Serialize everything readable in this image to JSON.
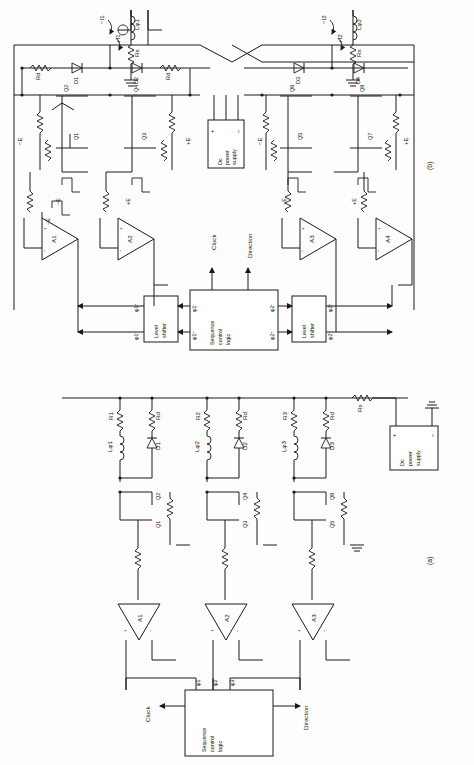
{
  "figure": {
    "orientation": "rotated-90",
    "part_labels": {
      "a": "(a)",
      "b": "(b)"
    }
  },
  "part_a": {
    "caption": "(a)",
    "description": "Unipolar three-phase stepper drive with suppression diodes",
    "phases": [
      {
        "winding": "Lφ1",
        "series_resistor": "R1",
        "damp_resistor": "Rd",
        "diode": "D1",
        "transistors": [
          "Q1",
          "Q2"
        ],
        "amplifier": "A1",
        "drive": "φ1"
      },
      {
        "winding": "Lφ2",
        "series_resistor": "R2",
        "damp_resistor": "Rd",
        "diode": "D2",
        "transistors": [
          "Q3",
          "Q4"
        ],
        "amplifier": "A2",
        "drive": "φ2"
      },
      {
        "winding": "Lφ3",
        "series_resistor": "R3",
        "damp_resistor": "Rd",
        "diode": "D3",
        "transistors": [
          "Q5",
          "Q6"
        ],
        "amplifier": "A3",
        "drive": "φ3"
      }
    ],
    "supply": {
      "label_line1": "Dc",
      "label_line2": "power",
      "label_line3": "supply",
      "plus": "+",
      "minus": "−",
      "series_resistor": "Rs"
    },
    "logic": {
      "label_line1": "Sequence",
      "label_line2": "control",
      "label_line3": "logic",
      "inputs": [
        "Clock",
        "Direction"
      ],
      "outputs": [
        "φ1",
        "φ2",
        "φ3"
      ]
    },
    "amplifier_labels": [
      "A1",
      "A2",
      "A3"
    ],
    "opamp_pins": {
      "plus": "+",
      "minus": "−"
    }
  },
  "part_b": {
    "caption": "(b)",
    "description": "Bipolar two-phase bridge stepper drive with level shifters",
    "bridges": [
      {
        "winding": "Lφ1",
        "series_resistor": "Rs",
        "currents": {
          "positive": "+I1",
          "negative": "−I1"
        },
        "diodes": [
          "D1",
          "D2"
        ],
        "damp_resistors": [
          "Rd",
          "Rd"
        ],
        "transistors_upper": [
          "Q2",
          "Q4"
        ],
        "transistors_lower": [
          "Q1",
          "Q3"
        ],
        "amplifiers": [
          "A1",
          "A2"
        ],
        "rails": [
          "−E",
          "+E"
        ],
        "drive_signals": [
          "φ1⁺",
          "φ1⁻"
        ],
        "level_shifter": {
          "label_line1": "Level",
          "label_line2": "shifter"
        }
      },
      {
        "winding": "Lφ2",
        "series_resistor": "Rs",
        "currents": {
          "positive": "+I2",
          "negative": "−I2"
        },
        "diodes": [
          "D3",
          "D4"
        ],
        "damp_resistors": [
          "Rd",
          "Rd"
        ],
        "transistors_upper": [
          "Q6",
          "Q8"
        ],
        "transistors_lower": [
          "Q5",
          "Q7"
        ],
        "amplifiers": [
          "A3",
          "A4"
        ],
        "rails": [
          "−E",
          "+E"
        ],
        "drive_signals": [
          "φ2⁺",
          "φ2⁻"
        ],
        "level_shifter": {
          "label_line1": "Level",
          "label_line2": "shifter"
        }
      }
    ],
    "supply": {
      "label_line1": "Dc",
      "label_line2": "power",
      "label_line3": "supply",
      "plus": "+",
      "minus": "−"
    },
    "logic": {
      "label_line1": "Sequence",
      "label_line2": "control",
      "label_line3": "logic",
      "inputs": [
        "Clock",
        "Direction"
      ],
      "outputs": [
        "φ1⁻",
        "φ1⁺",
        "φ2⁻",
        "φ2⁺"
      ]
    },
    "waveform_rails": [
      "−E",
      "+E"
    ],
    "opamp_pins": {
      "plus": "+",
      "minus": "−"
    }
  }
}
